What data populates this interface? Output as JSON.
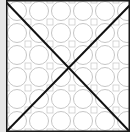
{
  "board": {
    "tile": {
      "pattern": "circle-lattice",
      "pattern_color": "#b8b8b8",
      "background": "#ffffff",
      "border_color": "#1a1a1a",
      "gutter_color": "#e6e6e6",
      "lines": [
        {
          "name": "diagonal-down",
          "from": [
            0,
            2
          ],
          "to": [
            124,
            132
          ]
        },
        {
          "name": "diagonal-up",
          "from": [
            0,
            132
          ],
          "to": [
            124,
            5
          ]
        }
      ],
      "line_color": "#111111"
    }
  }
}
